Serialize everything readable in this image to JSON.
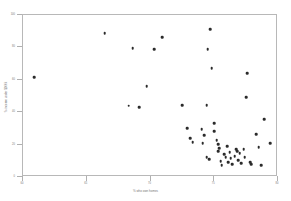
{
  "chart_data": {
    "type": "scatter",
    "title": "",
    "xlabel": "% who own homes",
    "ylabel": "% income under $100k",
    "xlim": [
      60,
      80
    ],
    "ylim": [
      0,
      100
    ],
    "xticks": [
      60,
      65,
      70,
      75,
      80
    ],
    "yticks": [
      0,
      20,
      40,
      60,
      80,
      100
    ],
    "xtick_labels": [
      "60",
      "65",
      "70",
      "75",
      "80"
    ],
    "ytick_labels": [
      "0",
      "20",
      "40",
      "60",
      "80",
      "100"
    ],
    "grid": false,
    "legend": null,
    "marker": {
      "shape": "circle",
      "color": "#2b2b2b",
      "size": 2.6
    },
    "frame": {
      "color": "#b8b8b8",
      "visible": true
    },
    "n_points": 51,
    "points": [
      {
        "x": 60.9,
        "y": 61.7
      },
      {
        "x": 66.4,
        "y": 88.9
      },
      {
        "x": 68.3,
        "y": 44.1
      },
      {
        "x": 68.6,
        "y": 79.6
      },
      {
        "x": 69.1,
        "y": 43.2
      },
      {
        "x": 69.7,
        "y": 56.2
      },
      {
        "x": 70.3,
        "y": 79.0
      },
      {
        "x": 70.9,
        "y": 86.4
      },
      {
        "x": 72.5,
        "y": 44.4
      },
      {
        "x": 72.9,
        "y": 30.2
      },
      {
        "x": 73.1,
        "y": 24.1
      },
      {
        "x": 73.3,
        "y": 21.6
      },
      {
        "x": 74.0,
        "y": 29.6
      },
      {
        "x": 74.1,
        "y": 21.0
      },
      {
        "x": 74.2,
        "y": 25.9
      },
      {
        "x": 74.4,
        "y": 44.4
      },
      {
        "x": 74.4,
        "y": 12.3
      },
      {
        "x": 74.5,
        "y": 79.0
      },
      {
        "x": 74.6,
        "y": 11.1
      },
      {
        "x": 74.7,
        "y": 91.4
      },
      {
        "x": 74.8,
        "y": 67.3
      },
      {
        "x": 75.0,
        "y": 33.3
      },
      {
        "x": 75.0,
        "y": 28.4
      },
      {
        "x": 75.2,
        "y": 22.8
      },
      {
        "x": 75.3,
        "y": 20.4
      },
      {
        "x": 75.3,
        "y": 16.0
      },
      {
        "x": 75.4,
        "y": 17.9
      },
      {
        "x": 75.5,
        "y": 9.9
      },
      {
        "x": 75.6,
        "y": 7.4
      },
      {
        "x": 75.8,
        "y": 14.2
      },
      {
        "x": 75.9,
        "y": 12.3
      },
      {
        "x": 76.0,
        "y": 19.1
      },
      {
        "x": 76.1,
        "y": 9.3
      },
      {
        "x": 76.2,
        "y": 15.4
      },
      {
        "x": 76.3,
        "y": 11.7
      },
      {
        "x": 76.4,
        "y": 8.0
      },
      {
        "x": 76.6,
        "y": 13.0
      },
      {
        "x": 76.7,
        "y": 17.3
      },
      {
        "x": 76.8,
        "y": 16.0
      },
      {
        "x": 76.9,
        "y": 10.5
      },
      {
        "x": 77.0,
        "y": 14.8
      },
      {
        "x": 77.1,
        "y": 8.6
      },
      {
        "x": 77.3,
        "y": 17.3
      },
      {
        "x": 77.4,
        "y": 12.3
      },
      {
        "x": 77.5,
        "y": 49.4
      },
      {
        "x": 77.6,
        "y": 64.2
      },
      {
        "x": 77.8,
        "y": 9.3
      },
      {
        "x": 77.9,
        "y": 8.0
      },
      {
        "x": 78.3,
        "y": 26.5
      },
      {
        "x": 78.5,
        "y": 18.5
      },
      {
        "x": 78.7,
        "y": 7.4
      },
      {
        "x": 78.9,
        "y": 35.8
      },
      {
        "x": 79.4,
        "y": 21.0
      }
    ]
  }
}
